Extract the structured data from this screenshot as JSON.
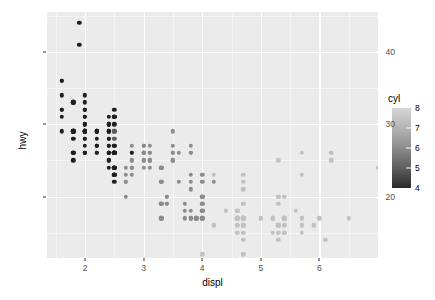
{
  "chart_data": {
    "type": "scatter",
    "title": "",
    "xlabel": "displ",
    "ylabel": "hwy",
    "xlim": [
      1.35,
      7.0
    ],
    "ylim": [
      11.5,
      45.5
    ],
    "xticks": [
      2,
      3,
      4,
      5,
      6
    ],
    "yticks": [
      20,
      30,
      40
    ],
    "xticklabels": [
      "2",
      "3",
      "4",
      "5",
      "6"
    ],
    "yticklabels": [
      "20",
      "30",
      "40"
    ],
    "x_minor_ticks": [
      1.5,
      2.5,
      3.5,
      4.5,
      5.5,
      6.5
    ],
    "y_minor_ticks": [
      15,
      25,
      35,
      45
    ],
    "grid": true,
    "panel_background": "#ebebeb",
    "grid_major_color": "#ffffff",
    "grid_minor_color": "#f5f5f5",
    "legend": {
      "title": "cyl",
      "position": "right",
      "type": "colorbar",
      "ticks": [
        4,
        5,
        6,
        7,
        8
      ],
      "ticklabels": [
        "4",
        "5",
        "6",
        "7",
        "8"
      ],
      "low_color": "#132b43",
      "high_color": "#56b1f7",
      "rendered_low_color": "#2b2b2b",
      "rendered_high_color": "#d6d6d6",
      "range": [
        4,
        8
      ]
    },
    "color_by": "cyl",
    "color_scale": {
      "4": "#1f1f1f",
      "5": "#5d5d5d",
      "6": "#8c8c8c",
      "8": "#c2c2c2"
    },
    "points": [
      [
        1.8,
        29,
        4
      ],
      [
        1.8,
        29,
        4
      ],
      [
        2.0,
        31,
        4
      ],
      [
        2.0,
        30,
        4
      ],
      [
        2.8,
        26,
        6
      ],
      [
        2.8,
        26,
        6
      ],
      [
        3.1,
        27,
        6
      ],
      [
        1.8,
        26,
        4
      ],
      [
        1.8,
        25,
        4
      ],
      [
        2.0,
        28,
        4
      ],
      [
        2.0,
        27,
        4
      ],
      [
        2.8,
        25,
        6
      ],
      [
        2.8,
        25,
        6
      ],
      [
        3.1,
        25,
        6
      ],
      [
        3.1,
        25,
        6
      ],
      [
        2.8,
        24,
        6
      ],
      [
        3.1,
        25,
        6
      ],
      [
        2.8,
        23,
        6
      ],
      [
        3.1,
        24,
        6
      ],
      [
        4.2,
        23,
        8
      ],
      [
        5.3,
        20,
        8
      ],
      [
        5.3,
        15,
        8
      ],
      [
        5.3,
        20,
        8
      ],
      [
        5.7,
        17,
        8
      ],
      [
        6.0,
        17,
        8
      ],
      [
        5.7,
        26,
        8
      ],
      [
        5.7,
        23,
        8
      ],
      [
        6.2,
        26,
        8
      ],
      [
        6.2,
        25,
        8
      ],
      [
        7.0,
        24,
        8
      ],
      [
        5.3,
        19,
        8
      ],
      [
        5.3,
        14,
        8
      ],
      [
        5.7,
        15,
        8
      ],
      [
        6.5,
        17,
        8
      ],
      [
        2.4,
        27,
        4
      ],
      [
        2.4,
        30,
        4
      ],
      [
        3.1,
        26,
        6
      ],
      [
        3.5,
        29,
        6
      ],
      [
        3.6,
        26,
        6
      ],
      [
        2.4,
        24,
        4
      ],
      [
        3.0,
        24,
        6
      ],
      [
        3.3,
        22,
        6
      ],
      [
        3.3,
        22,
        6
      ],
      [
        3.3,
        24,
        6
      ],
      [
        3.3,
        24,
        6
      ],
      [
        3.3,
        17,
        6
      ],
      [
        3.8,
        22,
        6
      ],
      [
        3.8,
        21,
        6
      ],
      [
        3.8,
        23,
        6
      ],
      [
        4.0,
        23,
        6
      ],
      [
        3.7,
        19,
        6
      ],
      [
        3.7,
        18,
        6
      ],
      [
        3.9,
        17,
        6
      ],
      [
        3.9,
        17,
        6
      ],
      [
        4.7,
        19,
        8
      ],
      [
        4.7,
        19,
        8
      ],
      [
        4.7,
        12,
        8
      ],
      [
        5.2,
        17,
        8
      ],
      [
        5.2,
        15,
        8
      ],
      [
        3.9,
        17,
        6
      ],
      [
        4.7,
        17,
        8
      ],
      [
        4.7,
        16,
        8
      ],
      [
        4.7,
        17,
        8
      ],
      [
        5.2,
        17,
        8
      ],
      [
        5.7,
        16,
        8
      ],
      [
        5.9,
        16,
        8
      ],
      [
        4.7,
        17,
        8
      ],
      [
        4.7,
        17,
        8
      ],
      [
        4.7,
        16,
        8
      ],
      [
        4.7,
        17,
        8
      ],
      [
        4.7,
        15,
        8
      ],
      [
        5.2,
        17,
        8
      ],
      [
        5.2,
        17,
        8
      ],
      [
        5.7,
        16,
        8
      ],
      [
        5.9,
        16,
        8
      ],
      [
        4.6,
        17,
        8
      ],
      [
        5.4,
        15,
        8
      ],
      [
        5.4,
        17,
        8
      ],
      [
        4.0,
        20,
        6
      ],
      [
        4.0,
        18,
        6
      ],
      [
        4.0,
        20,
        6
      ],
      [
        4.0,
        18,
        6
      ],
      [
        4.6,
        17,
        8
      ],
      [
        5.0,
        17,
        8
      ],
      [
        4.2,
        16,
        8
      ],
      [
        4.2,
        16,
        8
      ],
      [
        4.6,
        17,
        8
      ],
      [
        4.6,
        15,
        8
      ],
      [
        4.6,
        17,
        8
      ],
      [
        5.4,
        15,
        8
      ],
      [
        5.4,
        17,
        8
      ],
      [
        3.8,
        17,
        6
      ],
      [
        3.8,
        17,
        6
      ],
      [
        4.0,
        12,
        8
      ],
      [
        4.0,
        17,
        8
      ],
      [
        4.6,
        16,
        8
      ],
      [
        4.6,
        18,
        8
      ],
      [
        4.6,
        17,
        8
      ],
      [
        5.4,
        16,
        8
      ],
      [
        1.6,
        29,
        4
      ],
      [
        1.6,
        32,
        4
      ],
      [
        1.6,
        34,
        4
      ],
      [
        1.6,
        36,
        4
      ],
      [
        1.6,
        36,
        4
      ],
      [
        1.8,
        29,
        4
      ],
      [
        1.8,
        26,
        4
      ],
      [
        1.8,
        28,
        4
      ],
      [
        2.0,
        26,
        4
      ],
      [
        2.4,
        29,
        4
      ],
      [
        2.4,
        26,
        4
      ],
      [
        2.5,
        26,
        4
      ],
      [
        2.5,
        26,
        4
      ],
      [
        3.3,
        24,
        6
      ],
      [
        2.0,
        29,
        4
      ],
      [
        2.0,
        29,
        4
      ],
      [
        2.0,
        33,
        4
      ],
      [
        2.0,
        32,
        4
      ],
      [
        2.7,
        22,
        6
      ],
      [
        2.7,
        20,
        6
      ],
      [
        2.7,
        22,
        6
      ],
      [
        3.0,
        26,
        6
      ],
      [
        3.7,
        17,
        6
      ],
      [
        4.0,
        17,
        6
      ],
      [
        4.7,
        17,
        8
      ],
      [
        4.7,
        14,
        8
      ],
      [
        4.7,
        17,
        8
      ],
      [
        5.7,
        17,
        8
      ],
      [
        6.1,
        14,
        8
      ],
      [
        4.0,
        22,
        6
      ],
      [
        4.2,
        22,
        6
      ],
      [
        4.4,
        18,
        8
      ],
      [
        4.6,
        18,
        8
      ],
      [
        5.4,
        17,
        8
      ],
      [
        5.4,
        17,
        8
      ],
      [
        5.4,
        17,
        8
      ],
      [
        4.0,
        19,
        6
      ],
      [
        4.0,
        19,
        6
      ],
      [
        4.6,
        17,
        8
      ],
      [
        5.0,
        17,
        8
      ],
      [
        2.4,
        29,
        4
      ],
      [
        2.4,
        27,
        4
      ],
      [
        2.5,
        31,
        4
      ],
      [
        2.5,
        32,
        4
      ],
      [
        3.5,
        27,
        6
      ],
      [
        3.5,
        26,
        6
      ],
      [
        3.0,
        26,
        6
      ],
      [
        3.0,
        25,
        6
      ],
      [
        3.5,
        25,
        6
      ],
      [
        3.3,
        17,
        6
      ],
      [
        3.3,
        17,
        6
      ],
      [
        4.0,
        20,
        6
      ],
      [
        5.6,
        18,
        8
      ],
      [
        3.1,
        26,
        6
      ],
      [
        3.8,
        26,
        6
      ],
      [
        3.8,
        26,
        6
      ],
      [
        3.8,
        27,
        6
      ],
      [
        5.3,
        25,
        8
      ],
      [
        2.5,
        24,
        4
      ],
      [
        2.5,
        24,
        4
      ],
      [
        2.5,
        24,
        4
      ],
      [
        2.5,
        24,
        4
      ],
      [
        2.5,
        23,
        4
      ],
      [
        2.5,
        23,
        4
      ],
      [
        2.5,
        23,
        4
      ],
      [
        2.5,
        22,
        4
      ],
      [
        2.5,
        23,
        4
      ],
      [
        2.5,
        24,
        4
      ],
      [
        2.2,
        29,
        4
      ],
      [
        2.2,
        29,
        4
      ],
      [
        2.4,
        26,
        4
      ],
      [
        2.4,
        26,
        4
      ],
      [
        3.0,
        26,
        6
      ],
      [
        3.0,
        26,
        6
      ],
      [
        3.5,
        25,
        6
      ],
      [
        2.2,
        28,
        4
      ],
      [
        2.2,
        27,
        4
      ],
      [
        2.4,
        25,
        4
      ],
      [
        2.4,
        25,
        4
      ],
      [
        3.0,
        26,
        6
      ],
      [
        3.0,
        25,
        6
      ],
      [
        3.3,
        24,
        6
      ],
      [
        1.8,
        33,
        4
      ],
      [
        1.8,
        33,
        4
      ],
      [
        2.0,
        32,
        4
      ],
      [
        2.0,
        32,
        4
      ],
      [
        2.8,
        26,
        4
      ],
      [
        1.9,
        44,
        4
      ],
      [
        2.0,
        29,
        4
      ],
      [
        2.0,
        29,
        4
      ],
      [
        2.0,
        29,
        4
      ],
      [
        2.0,
        29,
        4
      ],
      [
        2.5,
        29,
        5
      ],
      [
        2.0,
        31,
        4
      ],
      [
        2.0,
        30,
        4
      ],
      [
        2.0,
        26,
        4
      ],
      [
        2.0,
        26,
        4
      ],
      [
        2.8,
        27,
        6
      ],
      [
        1.9,
        41,
        4
      ],
      [
        2.0,
        28,
        4
      ],
      [
        2.0,
        26,
        4
      ],
      [
        2.5,
        28,
        5
      ],
      [
        2.5,
        29,
        5
      ],
      [
        1.8,
        26,
        4
      ],
      [
        1.8,
        29,
        4
      ],
      [
        2.0,
        29,
        4
      ],
      [
        2.0,
        29,
        4
      ],
      [
        2.8,
        24,
        6
      ],
      [
        2.8,
        24,
        6
      ],
      [
        3.6,
        22,
        6
      ],
      [
        2.5,
        26,
        4
      ],
      [
        2.5,
        26,
        4
      ],
      [
        2.5,
        26,
        4
      ],
      [
        2.5,
        26,
        4
      ],
      [
        2.5,
        26,
        4
      ],
      [
        2.5,
        27,
        4
      ],
      [
        2.2,
        26,
        4
      ],
      [
        2.2,
        26,
        4
      ],
      [
        2.5,
        26,
        4
      ],
      [
        2.5,
        26,
        4
      ],
      [
        2.5,
        26,
        4
      ],
      [
        2.5,
        27,
        4
      ],
      [
        2.7,
        23,
        6
      ],
      [
        2.7,
        24,
        6
      ],
      [
        3.4,
        20,
        6
      ],
      [
        3.4,
        20,
        6
      ],
      [
        4.0,
        17,
        6
      ],
      [
        4.7,
        17,
        8
      ],
      [
        2.2,
        27,
        4
      ],
      [
        2.2,
        27,
        4
      ],
      [
        2.4,
        26,
        4
      ],
      [
        2.4,
        26,
        4
      ],
      [
        3.0,
        26,
        6
      ],
      [
        3.0,
        26,
        6
      ],
      [
        3.5,
        25,
        6
      ],
      [
        2.2,
        29,
        4
      ],
      [
        2.2,
        29,
        4
      ],
      [
        2.4,
        28,
        4
      ],
      [
        2.4,
        28,
        4
      ],
      [
        3.0,
        27,
        6
      ],
      [
        3.0,
        27,
        6
      ],
      [
        3.5,
        26,
        6
      ],
      [
        1.6,
        31,
        4
      ],
      [
        1.6,
        32,
        4
      ],
      [
        1.8,
        33,
        4
      ],
      [
        2.0,
        34,
        4
      ],
      [
        2.4,
        31,
        4
      ],
      [
        2.4,
        30,
        4
      ],
      [
        2.5,
        31,
        4
      ],
      [
        2.5,
        30,
        4
      ],
      [
        2.4,
        29,
        4
      ],
      [
        2.5,
        31,
        4
      ],
      [
        2.4,
        30,
        4
      ],
      [
        3.3,
        19,
        6
      ],
      [
        3.3,
        19,
        6
      ],
      [
        3.3,
        19,
        6
      ],
      [
        3.8,
        17,
        6
      ],
      [
        3.8,
        18,
        6
      ],
      [
        4.0,
        20,
        6
      ],
      [
        4.4,
        18,
        8
      ],
      [
        4.6,
        18,
        8
      ],
      [
        5.4,
        17,
        8
      ],
      [
        5.4,
        17,
        8
      ],
      [
        5.4,
        20,
        8
      ],
      [
        3.4,
        19,
        6
      ],
      [
        3.4,
        19,
        6
      ],
      [
        4.0,
        18,
        6
      ],
      [
        4.0,
        18,
        6
      ],
      [
        4.7,
        22,
        8
      ],
      [
        4.7,
        21,
        8
      ],
      [
        4.7,
        23,
        8
      ],
      [
        5.3,
        16,
        8
      ],
      [
        5.3,
        16,
        8
      ],
      [
        5.3,
        16,
        8
      ],
      [
        5.3,
        16,
        8
      ]
    ]
  }
}
